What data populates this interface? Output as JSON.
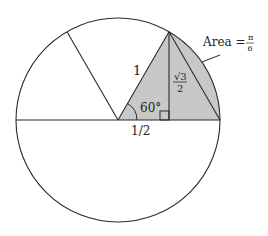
{
  "diagram": {
    "labels": {
      "hypotenuse": "1",
      "angle": "60°",
      "base": "1/2",
      "height_num": "√3",
      "height_den": "2",
      "area_prefix": "Area =",
      "area_num": "π",
      "area_den": "6"
    },
    "colors": {
      "stroke": "#2a2a2a",
      "shade": "#c8c8c8",
      "background": "#ffffff"
    }
  }
}
